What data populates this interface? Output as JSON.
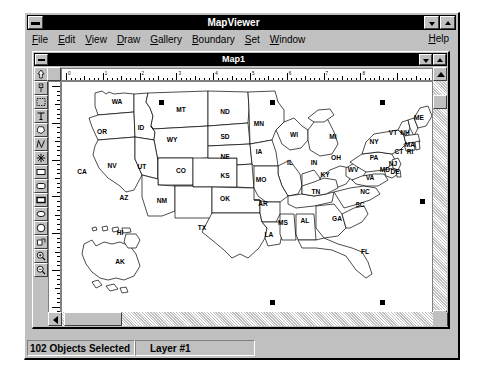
{
  "app": {
    "title": "MapViewer",
    "sysmenu_icon": "system-menu-icon",
    "minimize_icon": "minimize-icon",
    "maximize_icon": "maximize-icon"
  },
  "menubar": {
    "items": [
      {
        "label": "File",
        "accel": "F"
      },
      {
        "label": "Edit",
        "accel": "E"
      },
      {
        "label": "View",
        "accel": "V"
      },
      {
        "label": "Draw",
        "accel": "D"
      },
      {
        "label": "Gallery",
        "accel": "G"
      },
      {
        "label": "Boundary",
        "accel": "B"
      },
      {
        "label": "Set",
        "accel": "S"
      },
      {
        "label": "Window",
        "accel": "W"
      }
    ],
    "help": {
      "label": "Help",
      "accel": "H"
    }
  },
  "map_window": {
    "title": "Map1",
    "restore_icon": "restore-down-icon",
    "maximize_icon": "maximize-icon",
    "sysmenu_icon": "system-menu-icon"
  },
  "tools": [
    {
      "name": "pointer-tool",
      "icon": "arrow-up-icon"
    },
    {
      "name": "symbol-tool",
      "icon": "pin-marker-icon"
    },
    {
      "name": "marquee-select-tool",
      "icon": "dotted-rectangle-icon"
    },
    {
      "name": "text-tool",
      "icon": "text-T-icon"
    },
    {
      "name": "polygon-tool",
      "icon": "polygon-icon"
    },
    {
      "name": "polyline-tool",
      "icon": "polyline-icon"
    },
    {
      "name": "symbol-star-tool",
      "icon": "asterisk-icon"
    },
    {
      "name": "rectangle-tool",
      "icon": "rectangle-icon"
    },
    {
      "name": "rounded-rect-tool",
      "icon": "rounded-rectangle-icon"
    },
    {
      "name": "filled-rect-tool",
      "icon": "filled-rectangle-icon"
    },
    {
      "name": "ellipse-tool",
      "icon": "ellipse-icon"
    },
    {
      "name": "circle-tool",
      "icon": "circle-icon"
    },
    {
      "name": "arc-shape-tool",
      "icon": "arc-shape-icon"
    },
    {
      "name": "zoom-in-tool",
      "icon": "magnifier-plus-icon"
    },
    {
      "name": "zoom-out-tool",
      "icon": "magnifier-minus-icon"
    }
  ],
  "rulers": {
    "horizontal_major_ticks": 8,
    "vertical_major_ticks": 6
  },
  "scrollbars": {
    "vertical": {
      "up_icon": "scroll-up-arrow-icon",
      "down_icon": "scroll-down-arrow-icon"
    },
    "horizontal": {
      "left_icon": "scroll-left-arrow-icon",
      "right_icon": "scroll-right-arrow-icon"
    }
  },
  "statusbar": {
    "objects_selected": "102 Objects Selected",
    "layer": "Layer #1"
  },
  "map": {
    "selection_handle_count": 3,
    "labels": [
      {
        "abbr": "WA",
        "x": 55,
        "y": 22
      },
      {
        "abbr": "OR",
        "x": 40,
        "y": 52
      },
      {
        "abbr": "ID",
        "x": 79,
        "y": 48
      },
      {
        "abbr": "MT",
        "x": 119,
        "y": 30
      },
      {
        "abbr": "ND",
        "x": 163,
        "y": 32
      },
      {
        "abbr": "MN",
        "x": 197,
        "y": 44
      },
      {
        "abbr": "WI",
        "x": 232,
        "y": 55
      },
      {
        "abbr": "MI",
        "x": 271,
        "y": 57
      },
      {
        "abbr": "ME",
        "x": 357,
        "y": 38
      },
      {
        "abbr": "VT",
        "x": 331,
        "y": 53
      },
      {
        "abbr": "NH",
        "x": 343,
        "y": 53
      },
      {
        "abbr": "NY",
        "x": 312,
        "y": 62
      },
      {
        "abbr": "MA",
        "x": 348,
        "y": 65
      },
      {
        "abbr": "CT",
        "x": 337,
        "y": 72
      },
      {
        "abbr": "RI",
        "x": 348,
        "y": 72
      },
      {
        "abbr": "SD",
        "x": 163,
        "y": 57
      },
      {
        "abbr": "WY",
        "x": 110,
        "y": 60
      },
      {
        "abbr": "IA",
        "x": 197,
        "y": 72
      },
      {
        "abbr": "IL",
        "x": 228,
        "y": 83
      },
      {
        "abbr": "IN",
        "x": 252,
        "y": 83
      },
      {
        "abbr": "OH",
        "x": 274,
        "y": 78
      },
      {
        "abbr": "PA",
        "x": 312,
        "y": 78
      },
      {
        "abbr": "NJ",
        "x": 331,
        "y": 84
      },
      {
        "abbr": "MD",
        "x": 323,
        "y": 90
      },
      {
        "abbr": "DE",
        "x": 333,
        "y": 92
      },
      {
        "abbr": "NE",
        "x": 163,
        "y": 77
      },
      {
        "abbr": "CA",
        "x": 20,
        "y": 92
      },
      {
        "abbr": "NV",
        "x": 50,
        "y": 86
      },
      {
        "abbr": "UT",
        "x": 80,
        "y": 87
      },
      {
        "abbr": "CO",
        "x": 119,
        "y": 91
      },
      {
        "abbr": "KS",
        "x": 163,
        "y": 96
      },
      {
        "abbr": "MO",
        "x": 199,
        "y": 100
      },
      {
        "abbr": "KY",
        "x": 263,
        "y": 95
      },
      {
        "abbr": "WV",
        "x": 291,
        "y": 90
      },
      {
        "abbr": "VA",
        "x": 308,
        "y": 98
      },
      {
        "abbr": "AZ",
        "x": 62,
        "y": 118
      },
      {
        "abbr": "NM",
        "x": 100,
        "y": 121
      },
      {
        "abbr": "OK",
        "x": 163,
        "y": 119
      },
      {
        "abbr": "AR",
        "x": 201,
        "y": 124
      },
      {
        "abbr": "TN",
        "x": 254,
        "y": 112
      },
      {
        "abbr": "NC",
        "x": 303,
        "y": 112
      },
      {
        "abbr": "SC",
        "x": 298,
        "y": 125
      },
      {
        "abbr": "MS",
        "x": 221,
        "y": 143
      },
      {
        "abbr": "AL",
        "x": 243,
        "y": 141
      },
      {
        "abbr": "GA",
        "x": 275,
        "y": 139
      },
      {
        "abbr": "TX",
        "x": 140,
        "y": 148
      },
      {
        "abbr": "LA",
        "x": 207,
        "y": 155
      },
      {
        "abbr": "FL",
        "x": 303,
        "y": 172
      },
      {
        "abbr": "AK",
        "x": 58,
        "y": 182
      },
      {
        "abbr": "HI",
        "x": 58,
        "y": 153
      }
    ]
  }
}
